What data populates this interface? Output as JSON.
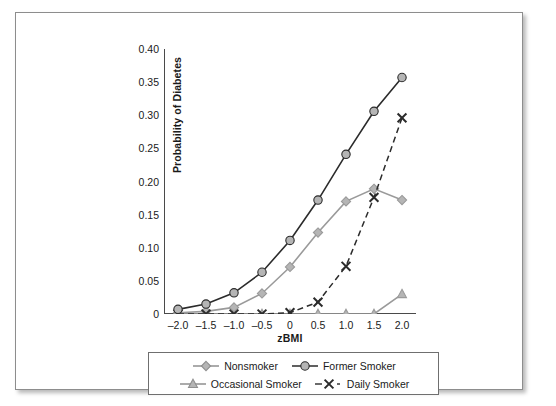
{
  "chart_data": {
    "type": "line",
    "title": "",
    "xlabel": "zBMI",
    "ylabel": "Probability of Diabetes",
    "x": [
      -2.0,
      -1.5,
      -1.0,
      -0.5,
      0,
      0.5,
      1.0,
      1.5,
      2.0
    ],
    "xtick_labels": [
      "–2.0",
      "–1.5",
      "–1.0",
      "–0.5",
      "0",
      "0.5",
      "1.0",
      "1.5",
      "2.0"
    ],
    "xlim": [
      -2.25,
      2.25
    ],
    "ylim": [
      0,
      0.4
    ],
    "ytick_values": [
      0,
      0.05,
      0.1,
      0.15,
      0.2,
      0.25,
      0.3,
      0.35,
      0.4
    ],
    "ytick_labels": [
      "0",
      "0.05",
      "0.10",
      "0.15",
      "0.20",
      "0.25",
      "0.30",
      "0.35",
      "0.40"
    ],
    "grid": false,
    "legend_position": "below-axes",
    "series": [
      {
        "name": "Nonsmoker",
        "marker": "diamond",
        "line_style": "solid",
        "color": "#9a9a9a",
        "values": [
          0.002,
          0.004,
          0.01,
          0.031,
          0.071,
          0.123,
          0.17,
          0.189,
          0.172
        ]
      },
      {
        "name": "Former Smoker",
        "marker": "circle",
        "line_style": "solid",
        "color": "#2b2b2b",
        "values": [
          0.007,
          0.015,
          0.032,
          0.063,
          0.111,
          0.172,
          0.241,
          0.306,
          0.357
        ]
      },
      {
        "name": "Occasional Smoker",
        "marker": "triangle",
        "line_style": "solid",
        "color": "#9a9a9a",
        "values": [
          0.0,
          0.0,
          0.0,
          0.0,
          0.0,
          0.0,
          0.0,
          0.0,
          0.03
        ]
      },
      {
        "name": "Daily Smoker",
        "marker": "x",
        "line_style": "dashed",
        "color": "#2b2b2b",
        "values": [
          0.0,
          0.0,
          0.0,
          0.0,
          0.002,
          0.018,
          0.072,
          0.176,
          0.296
        ]
      }
    ]
  },
  "legend": {
    "items": [
      {
        "label": "Nonsmoker",
        "marker": "diamond",
        "line_style": "solid",
        "color": "#8f8f8f"
      },
      {
        "label": "Former Smoker",
        "marker": "circle",
        "line_style": "solid",
        "color": "#2b2b2b"
      },
      {
        "label": "Occasional Smoker",
        "marker": "triangle",
        "line_style": "solid",
        "color": "#8f8f8f"
      },
      {
        "label": "Daily Smoker",
        "marker": "x",
        "line_style": "dashed",
        "color": "#2b2b2b"
      }
    ]
  },
  "colors": {
    "axis": "#4a4a4a",
    "frame": "#8d8d8d",
    "dark_series": "#2b2b2b",
    "light_series": "#9a9a9a",
    "marker_fill": "#b5b5b5",
    "background": "#ffffff"
  }
}
